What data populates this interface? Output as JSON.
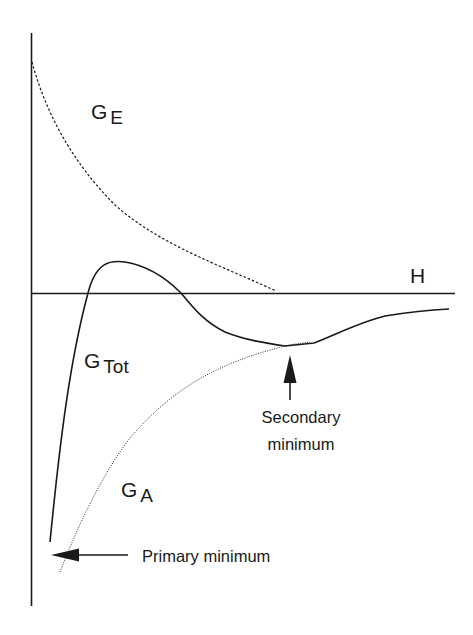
{
  "diagram": {
    "type": "energy-vs-separation",
    "axis": {
      "horizontal_label": "H"
    },
    "curves": [
      {
        "id": "G_E",
        "symbol": "G",
        "subscript": "E",
        "style": "dashed"
      },
      {
        "id": "G_Tot",
        "symbol": "G",
        "subscript": "Tot",
        "style": "solid"
      },
      {
        "id": "G_A",
        "symbol": "G",
        "subscript": "A",
        "style": "dotted"
      }
    ],
    "annotations": {
      "secondary_line1": "Secondary",
      "secondary_line2": "minimum",
      "primary": "Primary minimum"
    },
    "colors": {
      "ink": "#1a1a1a",
      "background": "#ffffff"
    }
  }
}
